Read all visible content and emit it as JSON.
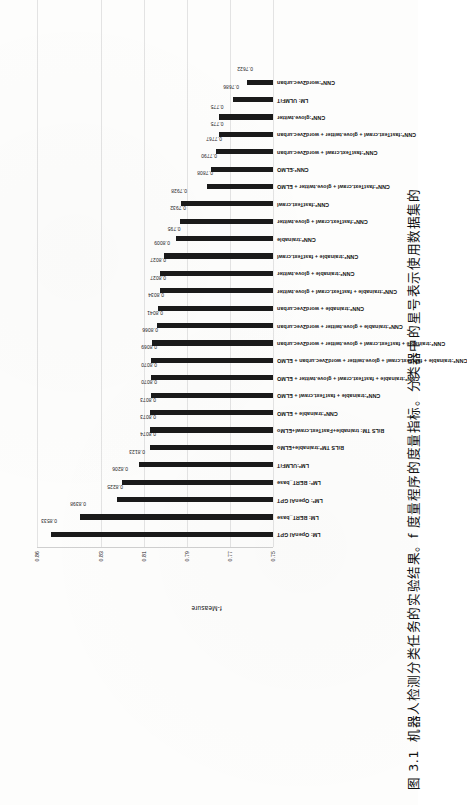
{
  "caption": {
    "number": "图 3.1",
    "text": "机器人检测分类任务的实验结果。f 度量程序的度量指标。分类器中的星号表示使用数据集的"
  },
  "chart_data": {
    "type": "bar",
    "title": "",
    "xlabel": "",
    "ylabel": "f-Measure",
    "ylim": [
      0.75,
      0.86
    ],
    "yticks": [
      0.75,
      0.77,
      0.79,
      0.81,
      0.83,
      0.86
    ],
    "ytick_labels": [
      "0.75",
      "0.77",
      "0.79",
      "0.81",
      "0.83",
      "0.86"
    ],
    "grid": true,
    "legend": "none",
    "orientation": "vertical-bars-rotated-page",
    "bar_color": "#1a1a1a",
    "categories": [
      "LM: OpenAI GPT",
      "LM: BERT_base",
      "LM*: OpenAI GPT",
      "LM*: BERT_base",
      "LM*:ULMFiT",
      "BiLS TM*:trainable+ELMo",
      "BiLS TM: trainable+FastText.crawl+ELMo",
      "CNN*:trainable + ELMO",
      "CNN*:trainable + fastText.crawl + ELMO",
      "CNN*:trainable + fastText.crawl + glove.twitter + ELMO",
      "CNN*:trainable + fastText.crawl + glove.twitter + word2vec.urban + ELMO",
      "CNN*:trainable + fastText.crawl + glove.twitter + word2vec.urban",
      "CNN*:trainable + glove.twitter + word2vec.urban",
      "CNN*:trainable + word2vec.urban",
      "CNN*:trainable + fastText.crawl + glove.twitter",
      "CNN*:trainable + glove.twitter",
      "CNN*:trainable + fastText.crawl",
      "CNN*:trainable",
      "CNN*:fastText.crawl + glove.twitter",
      "CNN*:fastText.crawl",
      "CNN*:fastText.crawl + glove.twitter + ELMO",
      "CNN*:ELMO",
      "CNN*:fastText.crawl + word2vec.urban",
      "CNN*:fastText.crawl + glove.twitter + word2vec.urban",
      "CNN*:glove.twitter",
      "LM: ULMFiT",
      "CNN*:word2vec.urban"
    ],
    "values": [
      0.8533,
      0.8398,
      0.8225,
      0.8206,
      0.8123,
      0.8074,
      0.8073,
      0.8073,
      0.807,
      0.807,
      0.8069,
      0.8066,
      0.8041,
      0.8034,
      0.8027,
      0.8027,
      0.8009,
      0.795,
      0.7932,
      0.7928,
      0.7808,
      0.779,
      0.7767,
      0.775,
      0.775,
      0.7686,
      0.7622
    ],
    "value_labels": [
      "0.8533",
      "0.8398",
      "0.8225",
      "0.8206",
      "0.8123",
      "0.8074",
      "0.8073",
      "0.8073",
      "0.8070",
      "0.8070",
      "0.8069",
      "0.8066",
      "0.8041",
      "0.8034",
      "0.8027",
      "0.8027",
      "0.8009",
      "0.795",
      "0.7932",
      "0.7928",
      "0.7808",
      "0.7790",
      "0.7767",
      "0.775",
      "0.775",
      "0.7686",
      "0.7622"
    ]
  }
}
